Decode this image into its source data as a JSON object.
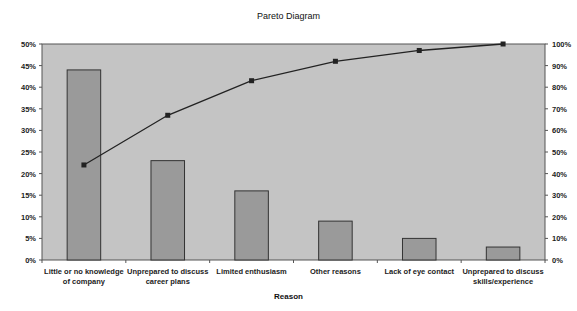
{
  "chart_data": {
    "type": "bar",
    "title": "Pareto Diagram",
    "xlabel": "Reason",
    "ylabel": "",
    "categories": [
      [
        "Little or no knowledge",
        "of company"
      ],
      [
        "Unprepared to discuss",
        "career plans"
      ],
      [
        "Limited enthusiasm"
      ],
      [
        "Other reasons"
      ],
      [
        "Lack of eye contact"
      ],
      [
        "Unprepared to discuss",
        "skills/experience"
      ]
    ],
    "series": [
      {
        "name": "Percentage",
        "type": "bar",
        "axis": "left",
        "values": [
          44,
          23,
          16,
          9,
          5,
          3
        ]
      },
      {
        "name": "Cumulative %",
        "type": "line",
        "axis": "right",
        "values": [
          44,
          67,
          83,
          92,
          97,
          100
        ]
      }
    ],
    "ylim": [
      0,
      50
    ],
    "y2lim": [
      0,
      100
    ],
    "yticks": [
      "0%",
      "5%",
      "10%",
      "15%",
      "20%",
      "25%",
      "30%",
      "35%",
      "40%",
      "45%",
      "50%"
    ],
    "y2ticks": [
      "0%",
      "10%",
      "20%",
      "30%",
      "40%",
      "50%",
      "60%",
      "70%",
      "80%",
      "90%",
      "100%"
    ],
    "grid": false,
    "legend": "none",
    "colors": {
      "plot_bg": "#c4c4c4",
      "bar": "#9a9a9a",
      "bar_edge": "#333333",
      "line": "#222222"
    }
  }
}
